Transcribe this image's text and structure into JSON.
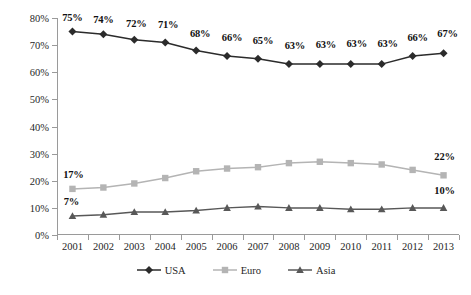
{
  "chart_data": {
    "type": "line",
    "title": "",
    "subtitle": "",
    "xlabel": "",
    "ylabel": "",
    "categories": [
      "2001",
      "2002",
      "2003",
      "2004",
      "2005",
      "2006",
      "2007",
      "2008",
      "2009",
      "2010",
      "2011",
      "2012",
      "2013"
    ],
    "ylim": [
      0,
      80
    ],
    "yticks": [
      0,
      10,
      20,
      30,
      40,
      50,
      60,
      70,
      80
    ],
    "ytick_labels": [
      "0%",
      "10%",
      "20%",
      "30%",
      "40%",
      "50%",
      "60%",
      "70%",
      "80%"
    ],
    "grid": false,
    "legend_position": "bottom",
    "series": [
      {
        "name": "USA",
        "color": "#2b2b2b",
        "marker": "diamond",
        "values": [
          75,
          74,
          72,
          71,
          68,
          66,
          65,
          63,
          63,
          63,
          63,
          66,
          67
        ],
        "labels": [
          "75%",
          "74%",
          "72%",
          "71%",
          "68%",
          "66%",
          "65%",
          "63%",
          "63%",
          "63%",
          "63%",
          "66%",
          "67%"
        ],
        "labels_shown": [
          true,
          true,
          true,
          true,
          true,
          true,
          true,
          true,
          true,
          true,
          true,
          true,
          true
        ]
      },
      {
        "name": "Euro",
        "color": "#b4b4b4",
        "marker": "square",
        "values": [
          17,
          17.5,
          19,
          21,
          23.5,
          24.5,
          25,
          26.5,
          27,
          26.5,
          26,
          24,
          22
        ],
        "labels": [
          "17%",
          "",
          "",
          "",
          "",
          "",
          "",
          "",
          "",
          "",
          "",
          "",
          "22%"
        ],
        "labels_shown": [
          true,
          false,
          false,
          false,
          false,
          false,
          false,
          false,
          false,
          false,
          false,
          false,
          true
        ]
      },
      {
        "name": "Asia",
        "color": "#585858",
        "marker": "triangle",
        "values": [
          7,
          7.5,
          8.5,
          8.5,
          9,
          10,
          10.5,
          10,
          10,
          9.5,
          9.5,
          10,
          10
        ],
        "labels": [
          "7%",
          "",
          "",
          "",
          "",
          "",
          "",
          "",
          "",
          "",
          "",
          "",
          "10%"
        ],
        "labels_shown": [
          true,
          false,
          false,
          false,
          false,
          false,
          false,
          false,
          false,
          false,
          false,
          false,
          true
        ]
      }
    ],
    "label_offsets": {
      "USA": [
        {
          "dx": 0,
          "dy": -9
        },
        {
          "dx": 0,
          "dy": -9
        },
        {
          "dx": 2,
          "dy": -11
        },
        {
          "dx": 3,
          "dy": -12
        },
        {
          "dx": 4,
          "dy": -12
        },
        {
          "dx": 5,
          "dy": -13
        },
        {
          "dx": 5,
          "dy": -13
        },
        {
          "dx": 6,
          "dy": -13
        },
        {
          "dx": 6,
          "dy": -14
        },
        {
          "dx": 6,
          "dy": -15
        },
        {
          "dx": 6,
          "dy": -15
        },
        {
          "dx": 5,
          "dy": -13
        },
        {
          "dx": 4,
          "dy": -14
        }
      ],
      "Euro": [
        {
          "dx": 1,
          "dy": -9
        },
        null,
        null,
        null,
        null,
        null,
        null,
        null,
        null,
        null,
        null,
        null,
        {
          "dx": 1,
          "dy": -13
        }
      ],
      "Asia": [
        {
          "dx": -1,
          "dy": -9
        },
        null,
        null,
        null,
        null,
        null,
        null,
        null,
        null,
        null,
        null,
        null,
        {
          "dx": 1,
          "dy": -12
        }
      ]
    }
  },
  "legend": {
    "items": [
      {
        "label": "USA",
        "color": "#2b2b2b",
        "marker": "diamond"
      },
      {
        "label": "Euro",
        "color": "#b4b4b4",
        "marker": "square"
      },
      {
        "label": "Asia",
        "color": "#585858",
        "marker": "triangle"
      }
    ]
  },
  "colors": {
    "axis": "#9a9a9a",
    "text": "#1f1f1f",
    "background": "#ffffff"
  }
}
